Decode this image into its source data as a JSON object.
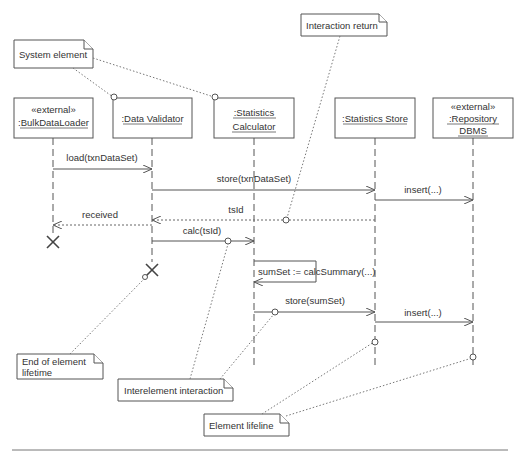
{
  "diagram": {
    "type": "UML sequence diagram",
    "lifelines": [
      {
        "id": "bulk",
        "stereotype": "«external»",
        "name": ":BulkDataLoader",
        "name2": ""
      },
      {
        "id": "validator",
        "stereotype": "",
        "name": ":Data Validator",
        "name2": ""
      },
      {
        "id": "calculator",
        "stereotype": "",
        "name": ":Statistics",
        "name2": "Calculator"
      },
      {
        "id": "store",
        "stereotype": "",
        "name": ":Statistics Store",
        "name2": ""
      },
      {
        "id": "dbms",
        "stereotype": "«external»",
        "name": ":Repository",
        "name2": "DBMS"
      }
    ],
    "messages": [
      {
        "label": "load(txnDataSet)",
        "from": "bulk",
        "to": "validator",
        "kind": "call"
      },
      {
        "label": "store(txnDataSet)",
        "from": "validator",
        "to": "store",
        "kind": "call"
      },
      {
        "label": "insert(...)",
        "from": "store",
        "to": "dbms",
        "kind": "call"
      },
      {
        "label": "tsId",
        "from": "store",
        "to": "validator",
        "kind": "return"
      },
      {
        "label": "received",
        "from": "validator",
        "to": "bulk",
        "kind": "return"
      },
      {
        "label": "calc(tsId)",
        "from": "validator",
        "to": "calculator",
        "kind": "call"
      },
      {
        "label": "sumSet := calcSummary(...)",
        "from": "calculator",
        "to": "calculator",
        "kind": "self"
      },
      {
        "label": "store(sumSet)",
        "from": "calculator",
        "to": "store",
        "kind": "call"
      },
      {
        "label": "insert(...)",
        "from": "store",
        "to": "dbms",
        "kind": "call"
      }
    ],
    "annotations": [
      {
        "id": "system-element",
        "text": "System element"
      },
      {
        "id": "interaction-return",
        "text": "Interaction return"
      },
      {
        "id": "end-of-lifetime",
        "line1": "End of element",
        "line2": "lifetime"
      },
      {
        "id": "interelement-interaction",
        "text": "Interelement interaction"
      },
      {
        "id": "element-lifeline",
        "text": "Element lifeline"
      }
    ]
  }
}
